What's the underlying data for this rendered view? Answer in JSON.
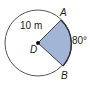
{
  "diagram": {
    "type": "circle-sector",
    "center_label": "D",
    "point_a_label": "A",
    "point_b_label": "B",
    "radius_label": "10 m",
    "angle_label": "80°",
    "sector_color": "#a3b5d6",
    "stroke_color": "#333333"
  }
}
